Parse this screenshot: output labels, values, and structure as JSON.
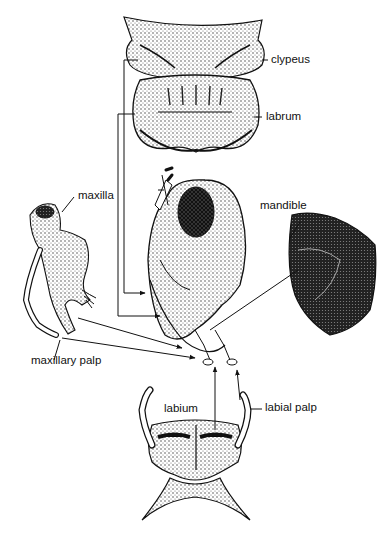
{
  "diagram": {
    "labels": {
      "clypeus": "clypeus",
      "labrum": "labrum",
      "maxilla": "maxilla",
      "mandible": "mandible",
      "maxillary_palp": "maxillary palp",
      "labium": "labium",
      "labial_palp": "labial palp"
    },
    "colors": {
      "ink": "#111111",
      "background": "#ffffff",
      "stipple": "#444444"
    }
  }
}
